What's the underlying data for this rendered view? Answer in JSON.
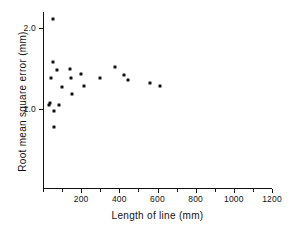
{
  "chart_data": {
    "type": "scatter",
    "title": "",
    "xlabel": "Length of line   (mm)",
    "ylabel": "Root mean square error  (mm)",
    "xlim": [
      0,
      1200
    ],
    "ylim": [
      0.35,
      2.2
    ],
    "grid": false,
    "legend": null,
    "x_ticks": [
      {
        "value": 0,
        "label": ""
      },
      {
        "value": 100,
        "label": ""
      },
      {
        "value": 200,
        "label": "200"
      },
      {
        "value": 300,
        "label": ""
      },
      {
        "value": 400,
        "label": "400"
      },
      {
        "value": 500,
        "label": ""
      },
      {
        "value": 600,
        "label": "600"
      },
      {
        "value": 700,
        "label": ""
      },
      {
        "value": 800,
        "label": "800"
      },
      {
        "value": 900,
        "label": ""
      },
      {
        "value": 1000,
        "label": "1000"
      },
      {
        "value": 1100,
        "label": ""
      },
      {
        "value": 1200,
        "label": "1200"
      }
    ],
    "y_ticks": [
      {
        "value": 1.0,
        "label": "1.0"
      },
      {
        "value": 2.0,
        "label": "2.0"
      }
    ],
    "points": [
      {
        "x": 50,
        "y": 2.11
      },
      {
        "x": 55,
        "y": 1.58
      },
      {
        "x": 75,
        "y": 1.48
      },
      {
        "x": 40,
        "y": 1.38
      },
      {
        "x": 140,
        "y": 1.5
      },
      {
        "x": 100,
        "y": 1.27
      },
      {
        "x": 145,
        "y": 1.38
      },
      {
        "x": 200,
        "y": 1.43
      },
      {
        "x": 375,
        "y": 1.52
      },
      {
        "x": 300,
        "y": 1.38
      },
      {
        "x": 425,
        "y": 1.42
      },
      {
        "x": 445,
        "y": 1.36
      },
      {
        "x": 150,
        "y": 1.19
      },
      {
        "x": 215,
        "y": 1.29
      },
      {
        "x": 560,
        "y": 1.32
      },
      {
        "x": 615,
        "y": 1.29
      },
      {
        "x": 30,
        "y": 1.05
      },
      {
        "x": 35,
        "y": 1.08
      },
      {
        "x": 60,
        "y": 0.97
      },
      {
        "x": 85,
        "y": 1.05
      },
      {
        "x": 60,
        "y": 0.78
      }
    ],
    "colors": {
      "marker": "#111111",
      "axis": "#111111",
      "background": "#ffffff"
    }
  }
}
